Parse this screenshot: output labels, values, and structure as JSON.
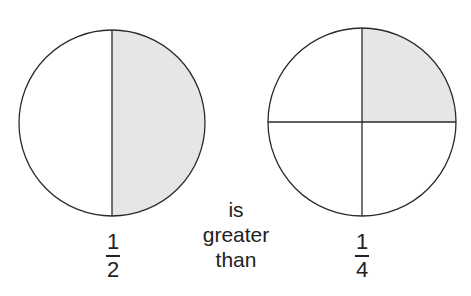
{
  "diagram": {
    "left_circle": {
      "parts": 2,
      "shaded_parts": 1,
      "fraction": {
        "numerator": "1",
        "denominator": "2"
      }
    },
    "right_circle": {
      "parts": 4,
      "shaded_parts": 1,
      "fraction": {
        "numerator": "1",
        "denominator": "4"
      }
    },
    "comparison_text": {
      "line1": "is",
      "line2": "greater",
      "line3": "than"
    },
    "colors": {
      "shade": "#e6e6e6",
      "stroke": "#2a2a2a",
      "background": "#ffffff"
    }
  }
}
